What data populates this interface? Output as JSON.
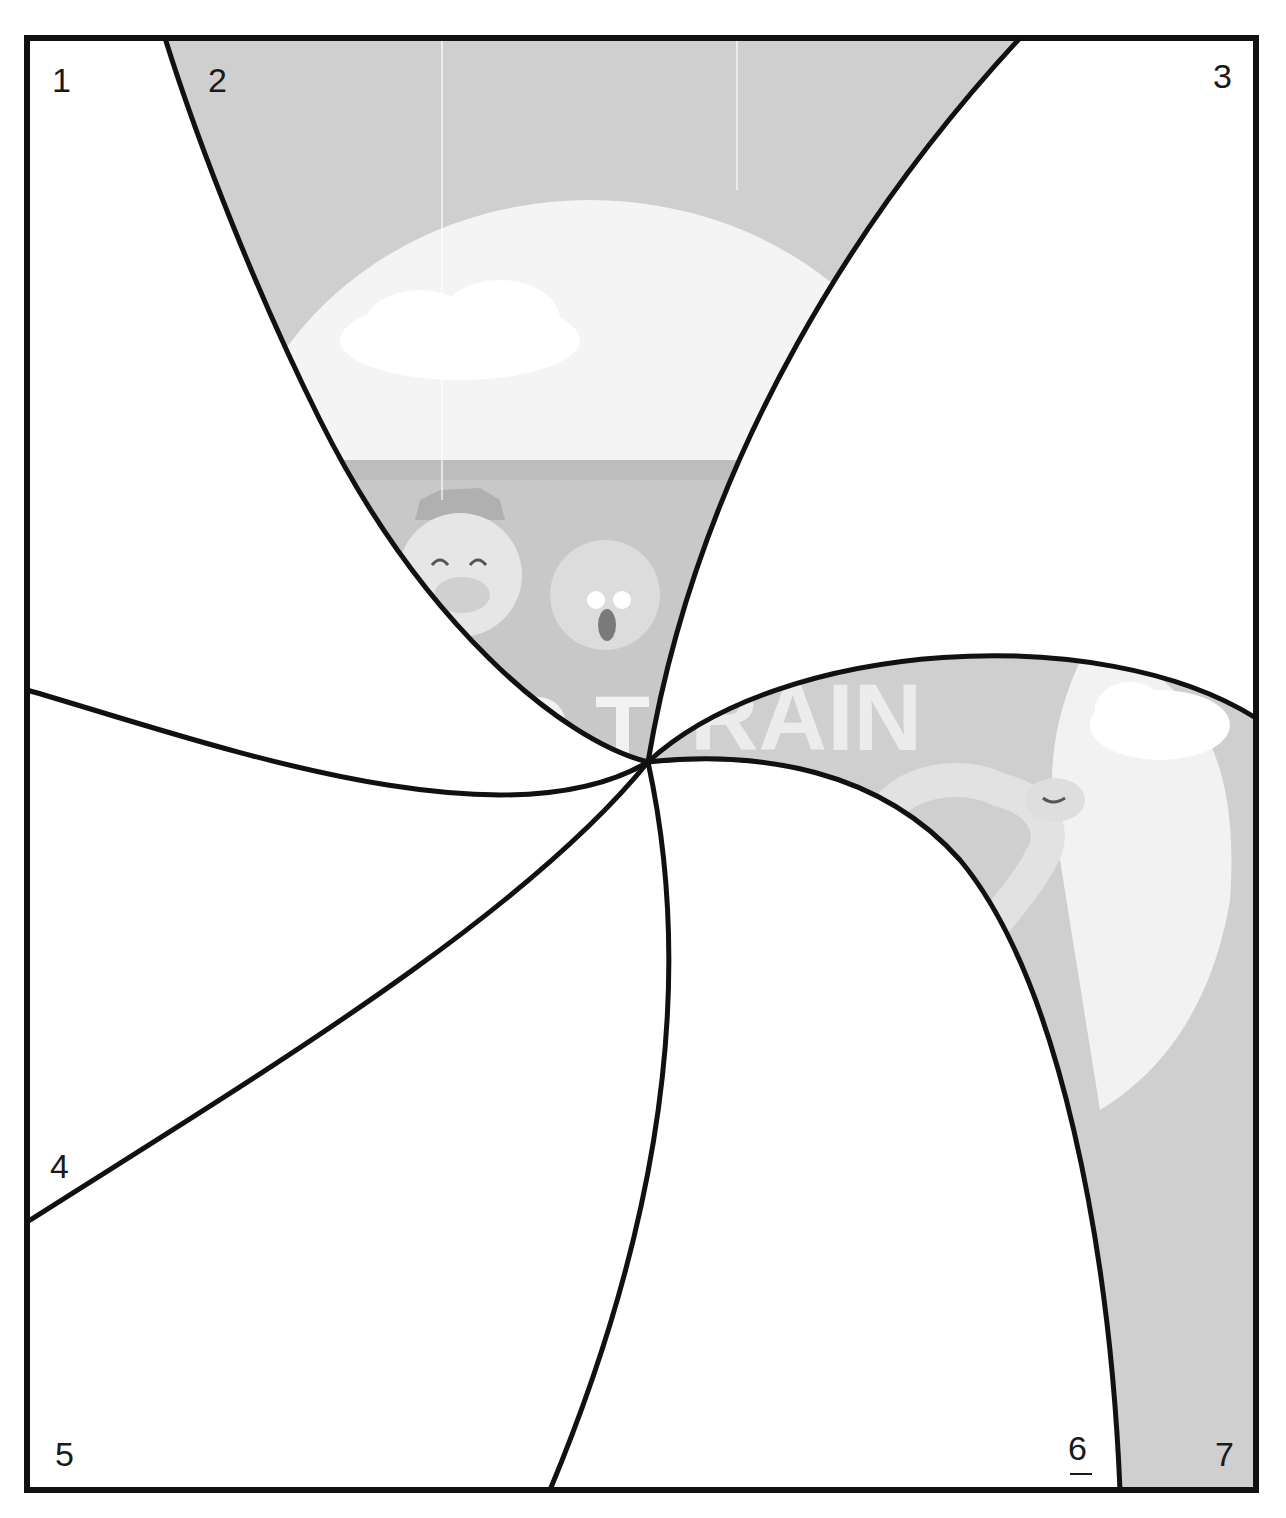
{
  "diagram": {
    "type": "region-division-puzzle",
    "region_labels": [
      {
        "id": "1",
        "text": "1",
        "x": 52,
        "y": 92,
        "underlined": false
      },
      {
        "id": "2",
        "text": "2",
        "x": 208,
        "y": 92,
        "underlined": false
      },
      {
        "id": "3",
        "text": "3",
        "x": 1213,
        "y": 88,
        "underlined": false
      },
      {
        "id": "4",
        "text": "4",
        "x": 50,
        "y": 1178,
        "underlined": false
      },
      {
        "id": "5",
        "text": "5",
        "x": 55,
        "y": 1466,
        "underlined": false
      },
      {
        "id": "6",
        "text": "6",
        "x": 1068,
        "y": 1460,
        "underlined": true
      },
      {
        "id": "7",
        "text": "7",
        "x": 1215,
        "y": 1466,
        "underlined": false
      }
    ],
    "shaded_regions": [
      "2",
      "7"
    ],
    "photo_content": {
      "description": "grayscale photo of toy animal train: pig with cowboy hat, koala, bird",
      "visible_lettering": "TRAIN"
    },
    "colors": {
      "line": "#111111",
      "shade": "#cfcfcf",
      "sky_light": "#f2f2f2",
      "background": "#ffffff"
    }
  }
}
